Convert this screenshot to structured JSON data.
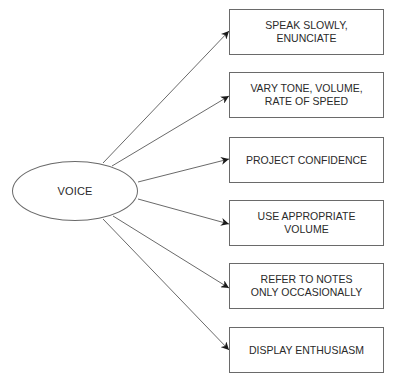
{
  "diagram": {
    "center": {
      "label": "VOICE"
    },
    "nodes": [
      {
        "label": "SPEAK SLOWLY,\nENUNCIATE"
      },
      {
        "label": "VARY TONE, VOLUME,\nRATE OF SPEED"
      },
      {
        "label": "PROJECT CONFIDENCE"
      },
      {
        "label": "USE APPROPRIATE\nVOLUME"
      },
      {
        "label": "REFER TO NOTES\nONLY OCCASIONALLY"
      },
      {
        "label": "DISPLAY ENTHUSIASM"
      }
    ],
    "colors": {
      "stroke": "#6a6a6a",
      "arrowhead": "#1a1a1a",
      "text": "#2a2a2a"
    }
  }
}
